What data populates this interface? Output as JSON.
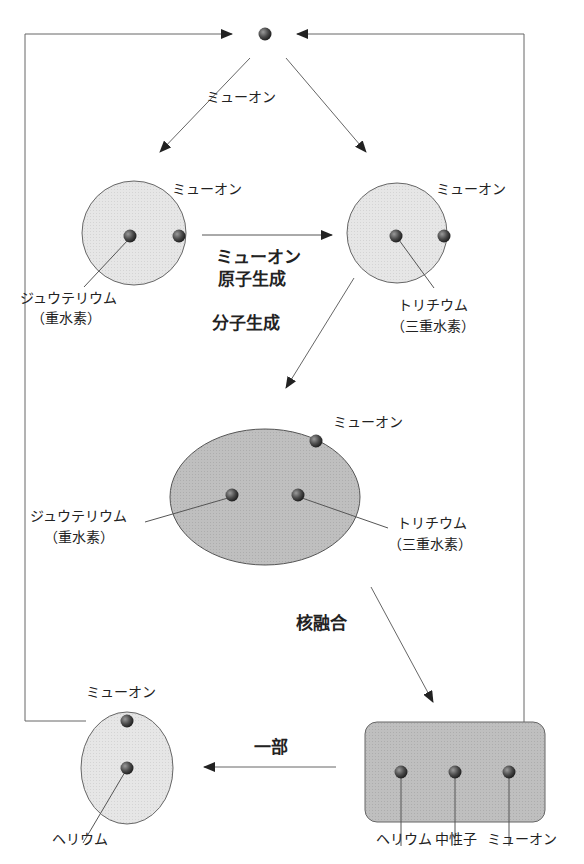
{
  "diagram": {
    "colors": {
      "line": "#555555",
      "light_fill": "#e4e4e4",
      "dark_fill": "#bdbdbd",
      "particle": "#4a4a4a"
    },
    "nodes": {
      "free_muon": {
        "label": ""
      },
      "deuterium_atom": {
        "muon_label": "ミューオン",
        "nucleus_label_1": "ジュウテリウム",
        "nucleus_label_2": "（重水素）"
      },
      "tritium_atom": {
        "muon_label": "ミューオン",
        "nucleus_label_1": "トリチウム",
        "nucleus_label_2": "（三重水素）"
      },
      "molecule": {
        "muon_label": "ミューオン",
        "left_label_1": "ジュウテリウム",
        "left_label_2": "（重水素）",
        "right_label_1": "トリチウム",
        "right_label_2": "（三重水素）"
      },
      "fusion_products": {
        "labels": [
          "ヘリウム",
          "中性子",
          "ミューオン"
        ]
      },
      "helium_atom": {
        "muon_label": "ミューオン",
        "nucleus_label": "ヘリウム"
      }
    },
    "edges": {
      "muon_to_atoms": "ミューオン",
      "atom_formation_1": "ミューオン",
      "atom_formation_2": "原子生成",
      "molecule_formation": "分子生成",
      "fusion": "核融合",
      "partial": "一部"
    }
  }
}
